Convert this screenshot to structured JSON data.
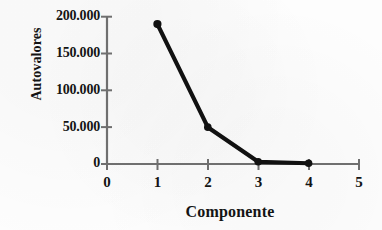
{
  "figure": {
    "background_color": "#fdfdfd",
    "line_color": "#111111",
    "axis_color": "#6f6f6f",
    "text_color": "#141414"
  },
  "chart_data": {
    "type": "line",
    "title": "",
    "subtitle": "",
    "xlabel": "Componente",
    "ylabel": "Autovalores",
    "x": [
      1,
      2,
      4,
      3
    ],
    "series": [
      {
        "name": "Autovalores",
        "x": [
          1,
          2,
          3,
          4
        ],
        "values": [
          190000,
          50000,
          3000,
          1000
        ]
      }
    ],
    "xlim": [
      0,
      5
    ],
    "ylim": [
      0,
      200000
    ],
    "xticks": [
      0,
      1,
      2,
      3,
      4,
      5
    ],
    "yticks": [
      0,
      50000,
      100000,
      150000,
      200000
    ],
    "xtick_labels": [
      "0",
      "1",
      "2",
      "3",
      "4",
      "5"
    ],
    "ytick_labels": [
      "0",
      "50.000",
      "100.000",
      "150.000",
      "200.000"
    ],
    "grid": false,
    "legend": false,
    "legend_position": "none",
    "marker": "filled-circle",
    "annotations": []
  },
  "axis": {
    "y_title": "Autovalores",
    "x_title": "Componente",
    "y_tick_0": "0",
    "y_tick_1": "50.000",
    "y_tick_2": "100.000",
    "y_tick_3": "150.000",
    "y_tick_4": "200.000",
    "x_tick_0": "0",
    "x_tick_1": "1",
    "x_tick_2": "2",
    "x_tick_3": "3",
    "x_tick_4": "4",
    "x_tick_5": "5"
  }
}
